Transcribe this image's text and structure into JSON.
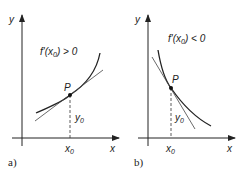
{
  "panels": [
    {
      "id": "a",
      "panel_label": "a)",
      "y_axis_label": "y",
      "x_axis_label": "x",
      "condition_prefix": "f'(x",
      "condition_sub": "0",
      "condition_suffix": ") > 0",
      "point_label": "P",
      "x0_label": "x",
      "x0_sub": "0",
      "y0_label": "y",
      "y0_sub": "0"
    },
    {
      "id": "b",
      "panel_label": "b)",
      "y_axis_label": "y",
      "x_axis_label": "x",
      "condition_prefix": "f'(x",
      "condition_sub": "0",
      "condition_suffix": ") < 0",
      "point_label": "P",
      "x0_label": "x",
      "x0_sub": "0",
      "y0_label": "y",
      "y0_sub": "0"
    }
  ],
  "colors": {
    "ink": "#222222",
    "background": "#ffffff"
  }
}
